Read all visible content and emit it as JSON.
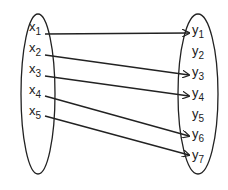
{
  "domain_set_x": {
    "name": "X",
    "elements": [
      {
        "base": "x",
        "sub": "1",
        "x": 29,
        "y": 31
      },
      {
        "base": "x",
        "sub": "2",
        "x": 29,
        "y": 52
      },
      {
        "base": "x",
        "sub": "3",
        "x": 29,
        "y": 73
      },
      {
        "base": "x",
        "sub": "4",
        "x": 29,
        "y": 94
      },
      {
        "base": "x",
        "sub": "5",
        "x": 29,
        "y": 115
      }
    ]
  },
  "codomain_set_y": {
    "name": "Y",
    "elements": [
      {
        "base": "y",
        "sub": "1",
        "x": 192,
        "y": 34
      },
      {
        "base": "y",
        "sub": "2",
        "x": 192,
        "y": 55
      },
      {
        "base": "y",
        "sub": "3",
        "x": 192,
        "y": 76
      },
      {
        "base": "y",
        "sub": "4",
        "x": 192,
        "y": 97
      },
      {
        "base": "y",
        "sub": "5",
        "x": 192,
        "y": 118
      },
      {
        "base": "y",
        "sub": "6",
        "x": 192,
        "y": 138
      },
      {
        "base": "y",
        "sub": "7",
        "x": 192,
        "y": 159
      }
    ]
  },
  "mappings": [
    {
      "from": "x1",
      "to": "y1",
      "x1": 45,
      "y1": 34,
      "x2": 189,
      "y2": 33
    },
    {
      "from": "x2",
      "to": "y3",
      "x1": 45,
      "y1": 55,
      "x2": 189,
      "y2": 75
    },
    {
      "from": "x3",
      "to": "y4",
      "x1": 45,
      "y1": 76,
      "x2": 189,
      "y2": 96
    },
    {
      "from": "x4",
      "to": "y6",
      "x1": 45,
      "y1": 96,
      "x2": 189,
      "y2": 136
    },
    {
      "from": "x5",
      "to": "y7",
      "x1": 45,
      "y1": 116,
      "x2": 189,
      "y2": 155
    }
  ],
  "colors": {
    "stroke": "#222222",
    "background": "#ffffff"
  }
}
